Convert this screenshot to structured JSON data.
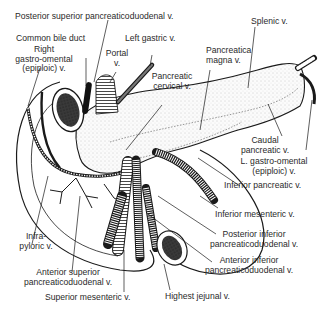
{
  "figure": {
    "colors": {
      "ink": "#1a1a1a",
      "label_text": "#2a2a2a",
      "background": "#ffffff",
      "stipple": "#e8e8e8"
    },
    "labels": {
      "posterior_superior_pd": "Posterior superior pancreaticoduodenal v.",
      "common_bile_duct": "Common bile duct",
      "right_go_1": "Right",
      "right_go_2": "gastro-omental",
      "right_go_3": "(epiploic) v.",
      "portal_1": "Portal",
      "portal_2": "v.",
      "left_gastric": "Left gastric v.",
      "splenic": "Splenic v.",
      "pancreatica_magna_1": "Pancreatica",
      "pancreatica_magna_2": "magna v.",
      "pancreatic_cervical_1": "Pancreatic",
      "pancreatic_cervical_2": "cervical v.",
      "caudal_1": "Caudal",
      "caudal_2": "pancreatic v.",
      "left_go_1": "L. gastro-omental",
      "left_go_2": "(epiploic) v.",
      "inferior_pancreatic": "Inferior pancreatic v.",
      "inferior_mesenteric": "Inferior mesenteric v.",
      "infrapyloric_1": "Infra-",
      "infrapyloric_2": "pyloric v.",
      "posterior_inferior_pd_1": "Posterior inferior",
      "posterior_inferior_pd_2": "pancreaticoduodenal v.",
      "anterior_inferior_pd_1": "Anterior inferior",
      "anterior_inferior_pd_2": "pancreaticoduodenal v.",
      "anterior_superior_pd_1": "Anterior superior",
      "anterior_superior_pd_2": "pancreaticoduodenal v.",
      "superior_mesenteric": "Superior mesenteric v.",
      "highest_jejunal": "Highest jejunal v."
    }
  }
}
